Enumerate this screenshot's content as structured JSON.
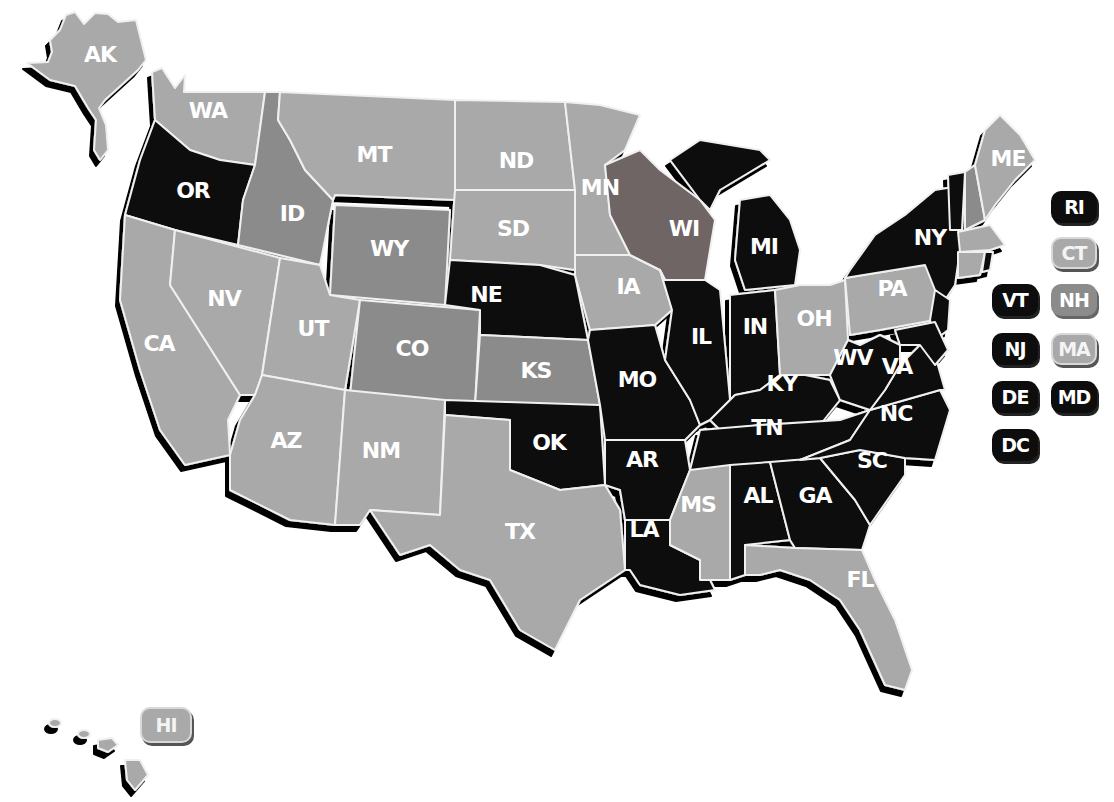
{
  "legend_colors": {
    "light": "#a9a9a9",
    "medium": "#8b8b8b",
    "dark_brown": "#6f6565",
    "black": "#0d0d0d"
  },
  "states": {
    "AK": {
      "label": "AK",
      "shade": "light"
    },
    "HI": {
      "label": "HI",
      "shade": "light"
    },
    "WA": {
      "label": "WA",
      "shade": "light"
    },
    "OR": {
      "label": "OR",
      "shade": "black"
    },
    "CA": {
      "label": "CA",
      "shade": "light"
    },
    "ID": {
      "label": "ID",
      "shade": "medium"
    },
    "NV": {
      "label": "NV",
      "shade": "light"
    },
    "MT": {
      "label": "MT",
      "shade": "light"
    },
    "WY": {
      "label": "WY",
      "shade": "medium"
    },
    "UT": {
      "label": "UT",
      "shade": "light"
    },
    "AZ": {
      "label": "AZ",
      "shade": "light"
    },
    "CO": {
      "label": "CO",
      "shade": "medium"
    },
    "NM": {
      "label": "NM",
      "shade": "light"
    },
    "ND": {
      "label": "ND",
      "shade": "light"
    },
    "SD": {
      "label": "SD",
      "shade": "light"
    },
    "NE": {
      "label": "NE",
      "shade": "black"
    },
    "KS": {
      "label": "KS",
      "shade": "medium"
    },
    "OK": {
      "label": "OK",
      "shade": "black"
    },
    "TX": {
      "label": "TX",
      "shade": "light"
    },
    "MN": {
      "label": "MN",
      "shade": "light"
    },
    "IA": {
      "label": "IA",
      "shade": "light"
    },
    "MO": {
      "label": "MO",
      "shade": "black"
    },
    "AR": {
      "label": "AR",
      "shade": "black"
    },
    "LA": {
      "label": "LA",
      "shade": "black"
    },
    "WI": {
      "label": "WI",
      "shade": "dark_brown"
    },
    "IL": {
      "label": "IL",
      "shade": "black"
    },
    "MI": {
      "label": "MI",
      "shade": "black"
    },
    "IN": {
      "label": "IN",
      "shade": "black"
    },
    "OH": {
      "label": "OH",
      "shade": "light"
    },
    "KY": {
      "label": "KY",
      "shade": "black"
    },
    "TN": {
      "label": "TN",
      "shade": "black"
    },
    "MS": {
      "label": "MS",
      "shade": "light"
    },
    "AL": {
      "label": "AL",
      "shade": "black"
    },
    "GA": {
      "label": "GA",
      "shade": "black"
    },
    "FL": {
      "label": "FL",
      "shade": "light"
    },
    "SC": {
      "label": "SC",
      "shade": "black"
    },
    "NC": {
      "label": "NC",
      "shade": "black"
    },
    "VA": {
      "label": "VA",
      "shade": "black"
    },
    "WV": {
      "label": "WV",
      "shade": "black"
    },
    "PA": {
      "label": "PA",
      "shade": "light"
    },
    "NY": {
      "label": "NY",
      "shade": "black"
    },
    "ME": {
      "label": "ME",
      "shade": "light"
    }
  },
  "badges": {
    "RI": {
      "label": "RI",
      "shade": "black"
    },
    "CT": {
      "label": "CT",
      "shade": "light"
    },
    "VT": {
      "label": "VT",
      "shade": "black"
    },
    "NH": {
      "label": "NH",
      "shade": "medium"
    },
    "NJ": {
      "label": "NJ",
      "shade": "black"
    },
    "MA": {
      "label": "MA",
      "shade": "light"
    },
    "DE": {
      "label": "DE",
      "shade": "black"
    },
    "MD": {
      "label": "MD",
      "shade": "black"
    },
    "DC": {
      "label": "DC",
      "shade": "black"
    },
    "HI": {
      "label": "HI",
      "shade": "light"
    }
  }
}
